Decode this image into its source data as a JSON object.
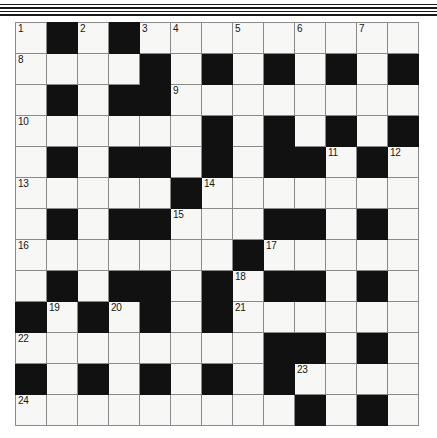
{
  "document": {
    "type": "crossword-puzzle-grid",
    "title": "Crossword Grid",
    "rows": 13,
    "columns": 13
  },
  "decorations": {
    "top_rules": [
      "thin",
      "thick",
      "thin",
      "thick"
    ]
  },
  "colors": {
    "block": "#111111",
    "open_cell": "#f7f7f5",
    "grid_line": "#8a8a8a",
    "border": "#4a4a4a",
    "number_text": "#161616",
    "page_background": "#ffffff"
  },
  "grid": {
    "legend": {
      "W": "open-cell",
      "B": "block-cell"
    },
    "cells": [
      [
        "W",
        "B",
        "W",
        "B",
        "W",
        "W",
        "W",
        "W",
        "W",
        "W",
        "W",
        "W",
        "W"
      ],
      [
        "W",
        "W",
        "W",
        "W",
        "B",
        "W",
        "B",
        "W",
        "B",
        "W",
        "B",
        "W",
        "B"
      ],
      [
        "W",
        "B",
        "W",
        "B",
        "B",
        "W",
        "W",
        "W",
        "W",
        "W",
        "W",
        "W",
        "W"
      ],
      [
        "W",
        "W",
        "W",
        "W",
        "W",
        "W",
        "B",
        "W",
        "B",
        "W",
        "B",
        "W",
        "B"
      ],
      [
        "W",
        "B",
        "W",
        "B",
        "B",
        "W",
        "B",
        "W",
        "B",
        "B",
        "W",
        "B",
        "W"
      ],
      [
        "W",
        "W",
        "W",
        "W",
        "W",
        "B",
        "W",
        "W",
        "W",
        "W",
        "W",
        "W",
        "W"
      ],
      [
        "W",
        "B",
        "W",
        "B",
        "B",
        "W",
        "W",
        "W",
        "B",
        "B",
        "W",
        "B",
        "W"
      ],
      [
        "W",
        "W",
        "W",
        "W",
        "W",
        "W",
        "W",
        "B",
        "W",
        "W",
        "W",
        "W",
        "W"
      ],
      [
        "W",
        "B",
        "W",
        "B",
        "B",
        "W",
        "B",
        "W",
        "B",
        "B",
        "W",
        "B",
        "W"
      ],
      [
        "B",
        "W",
        "B",
        "W",
        "B",
        "W",
        "B",
        "W",
        "W",
        "W",
        "W",
        "W",
        "W"
      ],
      [
        "W",
        "W",
        "W",
        "W",
        "W",
        "W",
        "W",
        "W",
        "B",
        "B",
        "W",
        "B",
        "W"
      ],
      [
        "B",
        "W",
        "B",
        "W",
        "B",
        "W",
        "B",
        "W",
        "B",
        "W",
        "W",
        "W",
        "W"
      ],
      [
        "W",
        "W",
        "W",
        "W",
        "W",
        "W",
        "W",
        "W",
        "W",
        "B",
        "W",
        "B",
        "W"
      ]
    ],
    "numbers": [
      {
        "label": "1",
        "row": 0,
        "col": 0
      },
      {
        "label": "2",
        "row": 0,
        "col": 2
      },
      {
        "label": "3",
        "row": 0,
        "col": 4
      },
      {
        "label": "4",
        "row": 0,
        "col": 5
      },
      {
        "label": "5",
        "row": 0,
        "col": 7
      },
      {
        "label": "6",
        "row": 0,
        "col": 9
      },
      {
        "label": "7",
        "row": 0,
        "col": 11
      },
      {
        "label": "8",
        "row": 1,
        "col": 0
      },
      {
        "label": "9",
        "row": 2,
        "col": 5
      },
      {
        "label": "10",
        "row": 3,
        "col": 0
      },
      {
        "label": "11",
        "row": 4,
        "col": 10
      },
      {
        "label": "12",
        "row": 4,
        "col": 12
      },
      {
        "label": "13",
        "row": 5,
        "col": 0
      },
      {
        "label": "14",
        "row": 5,
        "col": 6
      },
      {
        "label": "15",
        "row": 6,
        "col": 5
      },
      {
        "label": "16",
        "row": 7,
        "col": 0
      },
      {
        "label": "17",
        "row": 7,
        "col": 8
      },
      {
        "label": "18",
        "row": 8,
        "col": 7
      },
      {
        "label": "19",
        "row": 9,
        "col": 1
      },
      {
        "label": "20",
        "row": 9,
        "col": 3
      },
      {
        "label": "21",
        "row": 9,
        "col": 7
      },
      {
        "label": "22",
        "row": 10,
        "col": 0
      },
      {
        "label": "23",
        "row": 11,
        "col": 9
      },
      {
        "label": "24",
        "row": 12,
        "col": 0
      }
    ]
  }
}
